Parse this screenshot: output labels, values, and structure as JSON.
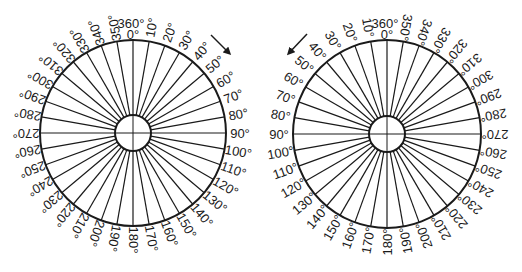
{
  "figure": {
    "colors": {
      "ink": "#1a1a1a",
      "background": "#ffffff"
    }
  },
  "dials": [
    {
      "name": "clockwise-dial",
      "center": [
        133,
        133
      ],
      "outer_radius": 93,
      "inner_radius": 18,
      "label_radius": 107,
      "direction": "clockwise",
      "arrow": {
        "from": [
          211,
          35
        ],
        "to": [
          229,
          53
        ]
      },
      "top_labels": [
        "360°",
        "0°"
      ],
      "labels": [
        "10°",
        "20°",
        "30°",
        "40°",
        "50°",
        "60°",
        "70°",
        "80°",
        "90°",
        "100°",
        "110°",
        "120°",
        "130°",
        "140°",
        "150°",
        "160°",
        "170°",
        "180°",
        "190°",
        "200°",
        "210°",
        "220°",
        "230°",
        "240°",
        "250°",
        "260°",
        "270°",
        "280°",
        "290°",
        "300°",
        "310°",
        "320°",
        "330°",
        "340°",
        "350°"
      ]
    },
    {
      "name": "counterclockwise-dial",
      "center": [
        387,
        134
      ],
      "outer_radius": 94,
      "inner_radius": 18,
      "label_radius": 108,
      "direction": "counterclockwise",
      "arrow": {
        "from": [
          307,
          34
        ],
        "to": [
          289,
          53
        ]
      },
      "top_labels": [
        "360°",
        "0°"
      ],
      "labels": [
        "10°",
        "20°",
        "30°",
        "40°",
        "50°",
        "60°",
        "70°",
        "80°",
        "90°",
        "100°",
        "110°",
        "120°",
        "130°",
        "140°",
        "150°",
        "160°",
        "170°",
        "180°",
        "190°",
        "200°",
        "210°",
        "220°",
        "230°",
        "240°",
        "250°",
        "260°",
        "270°",
        "280°",
        "290°",
        "300°",
        "310°",
        "320°",
        "330°",
        "340°",
        "350°"
      ]
    }
  ]
}
